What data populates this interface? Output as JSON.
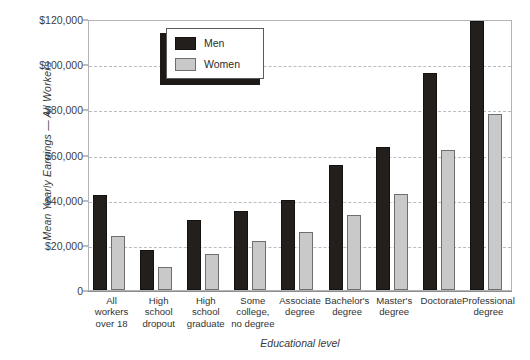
{
  "chart_data": {
    "type": "bar",
    "title": "",
    "xlabel": "Educational level",
    "ylabel": "Mean Yearly Earnings — All Workers",
    "ylim": [
      0,
      120000
    ],
    "ytick_values": [
      0,
      20000,
      40000,
      60000,
      80000,
      100000,
      120000
    ],
    "ytick_labels": [
      "0",
      "$20,000",
      "$40,000",
      "$60,000",
      "$80,000",
      "$100,000",
      "$120,000"
    ],
    "grid": "horizontal-dashed",
    "legend_position": "upper-left-inside",
    "categories": [
      "All workers over 18",
      "High school dropout",
      "High school graduate",
      "Some college, no degree",
      "Associate degree",
      "Bachelor's degree",
      "Master's degree",
      "Doctorate",
      "Professional degree"
    ],
    "category_lines": [
      [
        "All",
        "workers",
        "over 18"
      ],
      [
        "High",
        "school",
        "dropout"
      ],
      [
        "High",
        "school",
        "graduate"
      ],
      [
        "Some",
        "college,",
        "no degree"
      ],
      [
        "Associate",
        "degree"
      ],
      [
        "Bachelor's",
        "degree"
      ],
      [
        "Master's",
        "degree"
      ],
      [
        "Doctorate"
      ],
      [
        "Professional",
        "degree"
      ]
    ],
    "series": [
      {
        "name": "Men",
        "color": "#231f1c",
        "values": [
          42000,
          17500,
          31000,
          35000,
          40000,
          55500,
          63500,
          96000,
          119000
        ]
      },
      {
        "name": "Women",
        "color": "#c9c9c9",
        "values": [
          24000,
          10000,
          16000,
          21500,
          25500,
          33000,
          42500,
          62000,
          78000
        ]
      }
    ]
  },
  "legend": {
    "entries": [
      {
        "label": "Men",
        "swatch": "men"
      },
      {
        "label": "Women",
        "swatch": "women"
      }
    ]
  }
}
